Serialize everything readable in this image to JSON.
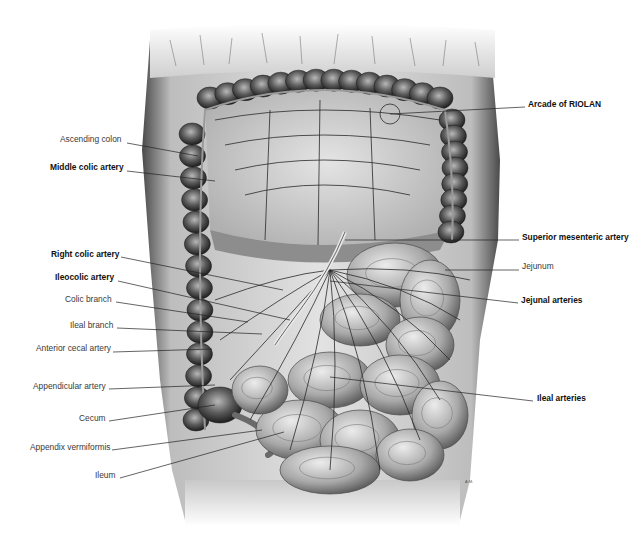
{
  "figure": {
    "style": "grayscale anatomical illustration"
  },
  "labels_left": [
    {
      "id": "ascending-colon",
      "text": "Ascending colon",
      "bold": false,
      "x": 60,
      "y": 138,
      "anchor_x": 127,
      "anchor_y": 143,
      "target_x": 198,
      "target_y": 156
    },
    {
      "id": "middle-colic-artery",
      "text": "Middle colic artery",
      "bold": true,
      "x": 50,
      "y": 166,
      "anchor_x": 127,
      "anchor_y": 171,
      "target_x": 215,
      "target_y": 181
    },
    {
      "id": "right-colic-artery",
      "text": "Right colic artery",
      "bold": true,
      "x": 51,
      "y": 253,
      "anchor_x": 121,
      "anchor_y": 257,
      "target_x": 283,
      "target_y": 290
    },
    {
      "id": "ileocolic-artery",
      "text": "Ileocolic artery",
      "bold": true,
      "x": 55,
      "y": 276,
      "anchor_x": 118,
      "anchor_y": 281,
      "target_x": 290,
      "target_y": 320
    },
    {
      "id": "colic-branch",
      "text": "Colic branch",
      "bold": false,
      "x": 65,
      "y": 298,
      "anchor_x": 116,
      "anchor_y": 302,
      "target_x": 248,
      "target_y": 322
    },
    {
      "id": "ileal-branch",
      "text": "Ileal branch",
      "bold": false,
      "x": 70,
      "y": 324,
      "anchor_x": 117,
      "anchor_y": 328,
      "target_x": 262,
      "target_y": 334
    },
    {
      "id": "anterior-cecal-artery",
      "text": "Anterior cecal artery",
      "bold": false,
      "x": 36,
      "y": 347,
      "anchor_x": 113,
      "anchor_y": 352,
      "target_x": 212,
      "target_y": 349
    },
    {
      "id": "appendicular-artery",
      "text": "Appendicular artery",
      "bold": false,
      "x": 33,
      "y": 385,
      "anchor_x": 109,
      "anchor_y": 389,
      "target_x": 215,
      "target_y": 385
    },
    {
      "id": "cecum",
      "text": "Cecum",
      "bold": false,
      "x": 79,
      "y": 417,
      "anchor_x": 109,
      "anchor_y": 421,
      "target_x": 215,
      "target_y": 405
    },
    {
      "id": "appendix-vermiformis",
      "text": "Appendix vermiformis",
      "bold": false,
      "x": 30,
      "y": 446,
      "anchor_x": 112,
      "anchor_y": 450,
      "target_x": 262,
      "target_y": 430
    },
    {
      "id": "ileum",
      "text": "Ileum",
      "bold": false,
      "x": 95,
      "y": 474,
      "anchor_x": 120,
      "anchor_y": 478,
      "target_x": 284,
      "target_y": 432
    }
  ],
  "labels_right": [
    {
      "id": "arcade-of-riolan",
      "text": "Arcade of RIOLAN",
      "bold": true,
      "x": 528,
      "y": 103,
      "anchor_x": 525,
      "anchor_y": 107,
      "target_x": 390,
      "target_y": 114
    },
    {
      "id": "superior-mesenteric-artery",
      "text": "Superior mesenteric artery",
      "bold": true,
      "x": 522,
      "y": 236,
      "anchor_x": 519,
      "anchor_y": 240,
      "target_x": 345,
      "target_y": 240
    },
    {
      "id": "jejunum",
      "text": "Jejunum",
      "bold": false,
      "x": 522,
      "y": 265,
      "anchor_x": 519,
      "anchor_y": 270,
      "target_x": 445,
      "target_y": 270
    },
    {
      "id": "jejunal-arteries",
      "text": "Jejunal arteries",
      "bold": true,
      "x": 521,
      "y": 299,
      "anchor_x": 518,
      "anchor_y": 303,
      "target_x": 330,
      "target_y": 281
    },
    {
      "id": "ileal-arteries",
      "text": "Ileal arteries",
      "bold": true,
      "x": 537,
      "y": 397,
      "anchor_x": 533,
      "anchor_y": 401,
      "target_x": 330,
      "target_y": 377
    }
  ],
  "colors": {
    "background": "#ffffff",
    "label_regular": "#3a3a3a",
    "label_bold": "#111111",
    "leader_line": "#222222",
    "tissue_light": "#d9d9d9",
    "tissue_mid": "#9a9a9a",
    "tissue_dark": "#3c3c3c",
    "vessel": "#2a2a2a"
  },
  "signature": "A.M."
}
